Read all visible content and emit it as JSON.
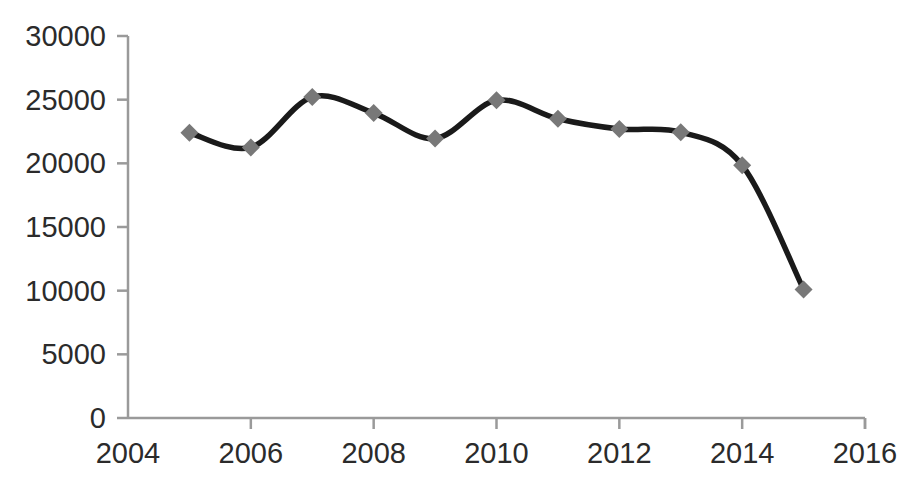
{
  "chart_data": {
    "type": "line",
    "title": "",
    "subtitle": "",
    "xlabel": "",
    "ylabel": "",
    "x": [
      2005,
      2006,
      2007,
      2008,
      2009,
      2010,
      2011,
      2012,
      2013,
      2014,
      2015
    ],
    "values": [
      22400,
      21250,
      25200,
      23950,
      21950,
      24950,
      23500,
      22700,
      22450,
      19850,
      10100
    ],
    "series": [
      {
        "name": "",
        "values": [
          22400,
          21250,
          25200,
          23950,
          21950,
          24950,
          23500,
          22700,
          22450,
          19850,
          10100
        ]
      }
    ],
    "xlim": [
      2004,
      2016
    ],
    "ylim": [
      0,
      30000
    ],
    "xticks": [
      2004,
      2006,
      2008,
      2010,
      2012,
      2014,
      2016
    ],
    "yticks": [
      0,
      5000,
      10000,
      15000,
      20000,
      25000,
      30000
    ],
    "xtick_labels": [
      "2004",
      "2006",
      "2008",
      "2010",
      "2012",
      "2014",
      "2016"
    ],
    "ytick_labels": [
      "0",
      "5000",
      "10000",
      "15000",
      "20000",
      "25000",
      "30000"
    ],
    "grid": false,
    "legend": false,
    "legend_position": "none",
    "smoothing": true,
    "marker": "diamond",
    "annotations": []
  },
  "style": {
    "line_color": "#1a1a1a",
    "marker_color": "#787878",
    "axis_color": "#9a9a9a",
    "tick_label_color": "#2b2b2b",
    "background_color": "#ffffff"
  },
  "axes": {
    "y_axis_name": "value-axis",
    "x_axis_name": "year-axis"
  }
}
